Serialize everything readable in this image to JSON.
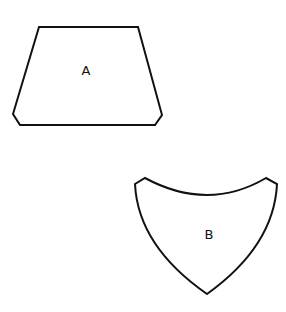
{
  "diagram": {
    "background": "#ffffff",
    "stroke_color": "#111111",
    "shapes": [
      {
        "id": "A",
        "label": "A",
        "type": "chamfered-trapezoid",
        "points": "39,27 138,27 162,115 155,125 20,125 13,114",
        "label_pos": {
          "x": 86,
          "y": 71
        }
      },
      {
        "id": "B",
        "label": "B",
        "type": "curved-shield",
        "path": "M135,184 L145,178 Q208,212 266,178 L277,184 Q274,246 207,294 Q138,246 135,184 Z",
        "label_pos": {
          "x": 209,
          "y": 235
        }
      }
    ]
  }
}
